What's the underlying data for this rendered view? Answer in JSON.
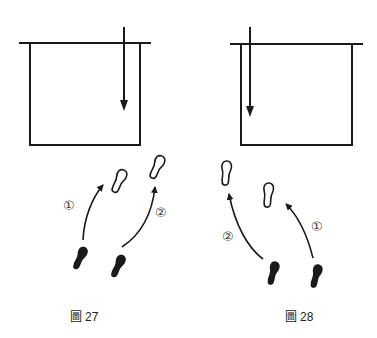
{
  "figures": [
    {
      "id": "fig27",
      "caption_prefix": "圖",
      "caption_number": "27",
      "labels": [
        "①",
        "②"
      ],
      "box_arrow_side": "right"
    },
    {
      "id": "fig28",
      "caption_prefix": "圖",
      "caption_number": "28",
      "labels": [
        "②",
        "①"
      ],
      "box_arrow_side": "left"
    }
  ],
  "colors": {
    "ink": "#1a1a1a",
    "background": "#ffffff"
  }
}
